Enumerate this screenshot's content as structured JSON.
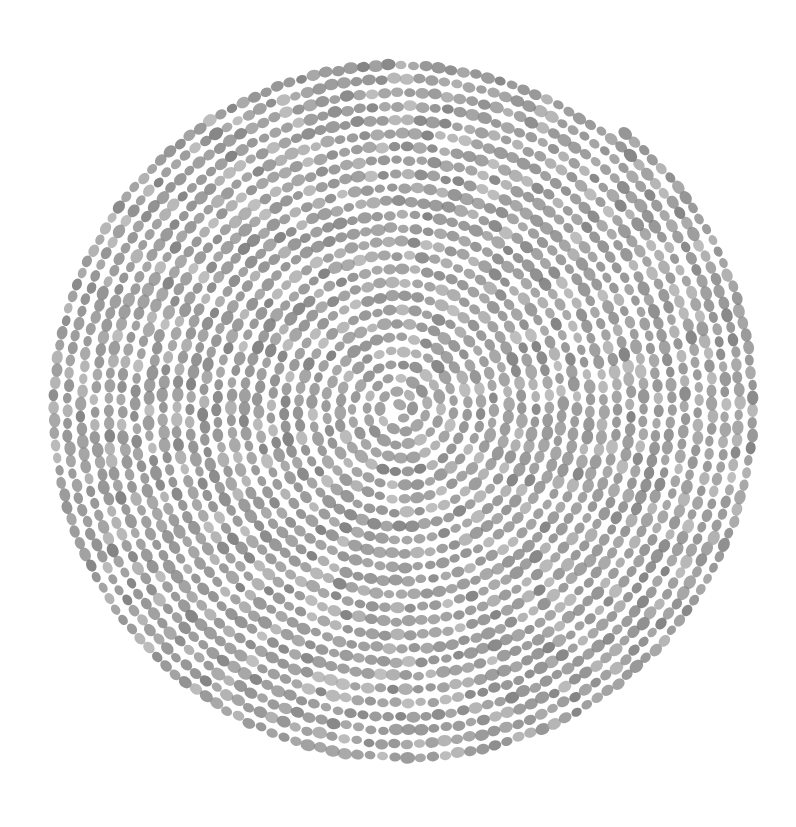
{
  "artwork": {
    "title": "Dotted Spiral",
    "description": "Hand-drawn Archimedean spiral rendered as a continuous chain of small gray oval beads on a white field",
    "medium": "ink-dot-stipple",
    "canvas": {
      "width": 796,
      "height": 827,
      "background_color": "#ffffff"
    }
  },
  "chart_data": {
    "type": "scatter",
    "xlabel": "",
    "ylabel": "",
    "grid": false,
    "legend": null,
    "xlim": [
      0,
      796
    ],
    "ylim": [
      0,
      827
    ],
    "spiral": {
      "form": "archimedean",
      "center_x": 400,
      "center_y": 408,
      "inner_radius": 3.0,
      "outer_radius": 355,
      "radius_growth_per_turn": 13.6,
      "turns": 26.0,
      "start_angle_deg": -95,
      "winding": "counterclockwise",
      "bead_spacing_px": 12.6,
      "bead_count_estimate": 4300,
      "end_point_x": 624,
      "end_point_y": 126
    },
    "bead": {
      "shape": "ellipse",
      "radius_x": 6.4,
      "radius_y": 5.0,
      "orientation": "tangent-to-path",
      "fill_color": "#8d8d8d",
      "fill_color_light": "#a8a8a8",
      "fill_color_dark": "#7a7a7a",
      "opacity": 0.92,
      "jitter_px": 1.1,
      "size_variation": 0.18
    },
    "extents": {
      "top_px": 54,
      "bottom_px": 776,
      "left_px": 56,
      "right_px": 749
    }
  },
  "palette": {
    "background": "#ffffff",
    "bead_mid": "#8d8d8d",
    "bead_light": "#a8a8a8",
    "bead_dark": "#7a7a7a"
  }
}
